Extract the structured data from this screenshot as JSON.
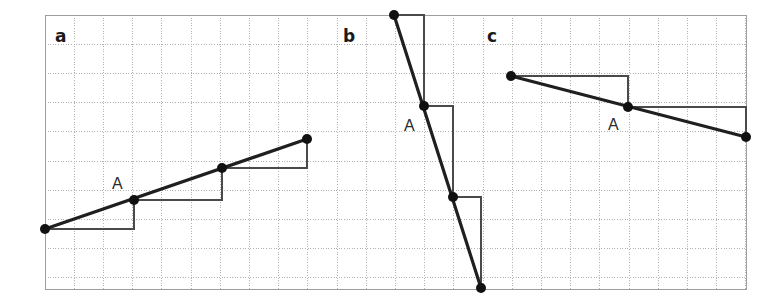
{
  "figure": {
    "width": 775,
    "height": 308,
    "background_color": "#ffffff",
    "grid": {
      "x0": 45,
      "y0": 15,
      "x1": 746,
      "y1": 289,
      "cell": 29.2,
      "line_color": "#b4b4b4",
      "line_dash": "1,1.6",
      "line_width": 1
    },
    "style": {
      "line_color": "#1f1f1f",
      "line_width": 3.2,
      "step_color": "#4a4a4a",
      "step_width": 2,
      "point_color": "#111111",
      "point_radius": 5
    }
  },
  "panels": [
    {
      "id": "a",
      "letter": "a",
      "letter_x": 55,
      "letter_y": 42,
      "label": "A",
      "label_x": 112,
      "label_y": 189,
      "description": "rising line, slope 1 up per 3 across",
      "line": {
        "x1": 45,
        "y1": 229,
        "x2": 307,
        "y2": 139
      },
      "points": [
        {
          "x": 45,
          "y": 229
        },
        {
          "x": 134,
          "y": 200
        },
        {
          "x": 222,
          "y": 168
        },
        {
          "x": 307,
          "y": 139
        }
      ],
      "steps": [
        {
          "run_x1": 45,
          "run_y": 229,
          "run_x2": 134,
          "rise_y2": 200
        },
        {
          "run_x1": 134,
          "run_y": 200,
          "run_x2": 222,
          "rise_y2": 168
        },
        {
          "run_x1": 222,
          "run_y": 168,
          "run_x2": 307,
          "rise_y2": 139
        }
      ]
    },
    {
      "id": "b",
      "letter": "b",
      "letter_x": 343,
      "letter_y": 42,
      "label": "A",
      "label_x": 404,
      "label_y": 131,
      "description": "steeply falling line, 3 down per 1 across",
      "line": {
        "x1": 394,
        "y1": 15,
        "x2": 481,
        "y2": 288
      },
      "points": [
        {
          "x": 394,
          "y": 15
        },
        {
          "x": 424,
          "y": 106
        },
        {
          "x": 453,
          "y": 197
        },
        {
          "x": 481,
          "y": 288
        }
      ],
      "steps": [
        {
          "run_x1": 394,
          "run_y": 15,
          "run_x2": 424,
          "rise_y2": 106
        },
        {
          "run_x1": 424,
          "run_y": 106,
          "run_x2": 453,
          "rise_y2": 197
        },
        {
          "run_x1": 453,
          "run_y": 197,
          "run_x2": 481,
          "rise_y2": 288
        }
      ]
    },
    {
      "id": "c",
      "letter": "c",
      "letter_x": 487,
      "letter_y": 42,
      "label": "A",
      "label_x": 608,
      "label_y": 130,
      "description": "gently falling line, 1 down per 4 across",
      "line": {
        "x1": 511,
        "y1": 76,
        "x2": 746,
        "y2": 137
      },
      "points": [
        {
          "x": 511,
          "y": 76
        },
        {
          "x": 628,
          "y": 107
        },
        {
          "x": 746,
          "y": 137
        }
      ],
      "steps": [
        {
          "run_x1": 511,
          "run_y": 76,
          "run_x2": 628,
          "rise_y2": 107
        },
        {
          "run_x1": 628,
          "run_y": 107,
          "run_x2": 746,
          "rise_y2": 137
        }
      ]
    }
  ],
  "chart_data": {
    "type": "line",
    "title": "",
    "xlabel": "",
    "ylabel": "",
    "grid": true,
    "legend": "none",
    "note": "Three coordinate-grid panels (a, b, c) each showing a straight line with slope-triangle step markers and a marked point A.",
    "series": [
      {
        "name": "a",
        "slope_rise": 1,
        "slope_run": 3,
        "grid_points": [
          [
            0,
            3
          ],
          [
            3,
            4
          ],
          [
            6,
            5
          ],
          [
            9,
            6
          ]
        ],
        "marked_point": "A",
        "marked_point_grid": [
          3,
          4
        ]
      },
      {
        "name": "b",
        "slope_rise": -3,
        "slope_run": 1,
        "grid_points": [
          [
            12,
            10
          ],
          [
            13,
            7
          ],
          [
            14,
            4
          ],
          [
            15,
            1
          ]
        ],
        "marked_point": "A",
        "marked_point_grid": [
          13,
          7
        ]
      },
      {
        "name": "c",
        "slope_rise": -1,
        "slope_run": 4,
        "grid_points": [
          [
            16,
            8
          ],
          [
            20,
            7
          ],
          [
            24,
            6
          ]
        ],
        "marked_point": "A",
        "marked_point_grid": [
          20,
          7
        ]
      }
    ]
  }
}
